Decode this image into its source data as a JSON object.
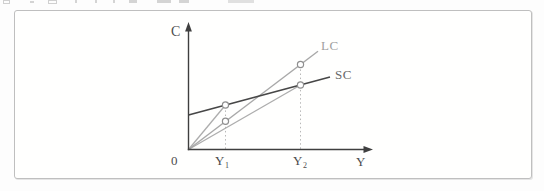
{
  "colors": {
    "axis": "#3f3f3f",
    "sc_line": "#474747",
    "lc_line": "#a8a8a8",
    "ray_line": "#adadad",
    "dotted_line": "#b8b8b8",
    "point_stroke": "#8f8f8f",
    "point_fill": "#ffffff",
    "frame_border": "#bfbfbf",
    "label_dark": "#4d4d4d",
    "label_gray": "#a0a0a0"
  },
  "figure": {
    "axes": {
      "vertical_label": "C",
      "horizontal_label": "Y",
      "origin_label": "0"
    },
    "x_ticks": [
      {
        "base": "Y",
        "sub": "1"
      },
      {
        "base": "Y",
        "sub": "2"
      }
    ],
    "curves": [
      {
        "label": "LC",
        "description": "light gray straight line through the origin, steeper slope, marked with open circles at Y1 and Y2"
      },
      {
        "label": "SC",
        "description": "dark straight line with positive vertical intercept, flatter slope, marked with open circles at Y1 and Y2"
      },
      {
        "label": "",
        "description": "thin gray ray from origin ending at the SC point above Y1"
      },
      {
        "label": "",
        "description": "thin gray ray from origin ending at the SC point above Y2"
      }
    ],
    "points": [
      {
        "x": "Y1",
        "on": "SC"
      },
      {
        "x": "Y1",
        "on": "LC"
      },
      {
        "x": "Y2",
        "on": "LC"
      },
      {
        "x": "Y2",
        "on": "SC"
      }
    ],
    "droplines": [
      {
        "x": "Y1",
        "style": "dotted vertical from axis up to SC point"
      },
      {
        "x": "Y2",
        "style": "dotted vertical from axis up to LC point"
      }
    ]
  }
}
